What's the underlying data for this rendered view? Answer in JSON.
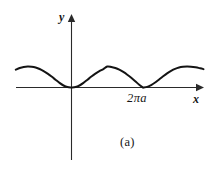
{
  "figure": {
    "caption": "(a)",
    "axis_label_x": "x",
    "axis_label_y": "y",
    "tick_label": "2πa"
  },
  "chart_data": {
    "type": "line",
    "title": "",
    "subtitle": "",
    "xlabel": "x",
    "ylabel": "y",
    "caption": "(a)",
    "curve_name": "cycloid",
    "parametric": {
      "x": "a(t - sin t)",
      "y": "a(1 - cos t)",
      "t_range": [
        -2.0,
        10.6
      ]
    },
    "cusps_x": [
      0,
      6.2832
    ],
    "cusp_labels": [
      "",
      "2πa"
    ],
    "arch_height": 2,
    "arch_period": 6.2832,
    "xticks": [
      6.2832
    ],
    "xtick_labels": [
      "2πa"
    ],
    "yticks": [],
    "ytick_labels": [],
    "xlim": [
      -4.9,
      11.6
    ],
    "ylim": [
      -4.6,
      3.3
    ],
    "grid": false,
    "legend": false,
    "legend_position": "none",
    "axes_style": "arrowed-cross",
    "series": [
      {
        "name": "cycloid",
        "x": [
          -4.9,
          -4.55,
          -4.2,
          -3.85,
          -3.5,
          -3.15,
          -2.8,
          -2.45,
          -2.1,
          -1.75,
          -1.4,
          -1.05,
          -0.7,
          -0.35,
          0.0,
          0.35,
          0.7,
          1.05,
          1.4,
          1.75,
          2.1,
          2.45,
          2.8,
          3.14,
          3.5,
          3.85,
          4.2,
          4.55,
          4.9,
          5.25,
          5.6,
          5.95,
          6.28,
          6.65,
          7.0,
          7.35,
          7.7,
          8.05,
          8.4,
          8.75,
          9.1,
          9.45,
          9.8,
          10.15,
          10.5,
          10.9,
          11.3,
          11.6
        ],
        "y": [
          1.7,
          1.86,
          1.96,
          2.0,
          1.98,
          1.9,
          1.76,
          1.56,
          1.32,
          1.04,
          0.74,
          0.44,
          0.19,
          0.04,
          0.0,
          0.04,
          0.19,
          0.44,
          0.74,
          1.04,
          1.32,
          1.56,
          1.76,
          2.0,
          1.96,
          1.86,
          1.7,
          1.48,
          1.22,
          0.92,
          0.6,
          0.26,
          0.0,
          0.06,
          0.22,
          0.47,
          0.77,
          1.07,
          1.35,
          1.58,
          1.77,
          1.9,
          1.97,
          2.0,
          1.98,
          1.92,
          1.83,
          1.75
        ]
      }
    ],
    "colors": {
      "curve": "#141414",
      "axis": "#2a2a2a",
      "background": "#ffffff"
    }
  }
}
